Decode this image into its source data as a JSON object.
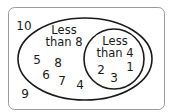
{
  "diagram": {
    "type": "venn",
    "universal": {
      "elements": [
        "10",
        "9"
      ]
    },
    "sets": [
      {
        "name": "less-than-8",
        "label_line1": "Less",
        "label_line2": "than 8",
        "only_elements": [
          "5",
          "8",
          "6",
          "7",
          "4"
        ]
      },
      {
        "name": "less-than-4",
        "label_line1": "Less",
        "label_line2": "than 4",
        "elements": [
          "2",
          "3",
          "1"
        ]
      }
    ],
    "colors": {
      "stroke": "#1a1a1a",
      "frame": "#9a9a9a",
      "text": "#1a1a1a",
      "background": "#ffffff"
    }
  }
}
